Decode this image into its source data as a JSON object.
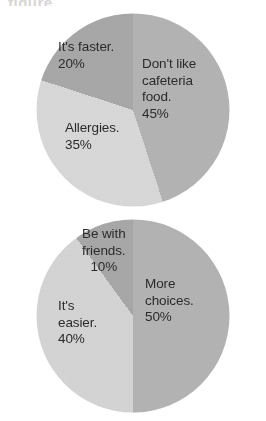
{
  "page": {
    "background": "#ffffff",
    "scan_artifact_text": "figure"
  },
  "palette": {
    "dark_gray": "#a9a9a9",
    "medium_gray": "#b6b6b6",
    "light_gray": "#d8d8d8",
    "lighter_gray": "#dcdcdc",
    "text": "#2b2b2b"
  },
  "charts": {
    "top": {
      "labels": {
        "faster": "It's faster.\n20%",
        "cafeteria": "Don't like\ncafeteria\nfood.\n45%",
        "allergies": "Allergies.\n35%"
      }
    },
    "bottom": {
      "labels": {
        "friends": "Be with\nfriends.\n10%",
        "choices": "More\nchoices.\n50%",
        "easier": "It's\neasier.\n40%"
      }
    }
  },
  "chart_data": [
    {
      "type": "pie",
      "title": "",
      "id": "top-pie",
      "categories": [
        "Don't like cafeteria food.",
        "Allergies.",
        "It's faster."
      ],
      "values": [
        45,
        35,
        20
      ],
      "unit": "%",
      "start_angle_deg": 0,
      "direction": "clockwise",
      "colors": [
        "#b6b6b6",
        "#dcdcdc",
        "#a9a9a9"
      ],
      "legend": "none",
      "labels_inside": true,
      "data_labels": [
        "45%",
        "35%",
        "20%"
      ]
    },
    {
      "type": "pie",
      "title": "",
      "id": "bottom-pie",
      "categories": [
        "More choices.",
        "It's easier.",
        "Be with friends."
      ],
      "values": [
        50,
        40,
        10
      ],
      "unit": "%",
      "start_angle_deg": 0,
      "direction": "clockwise",
      "colors": [
        "#b6b6b6",
        "#d8d8d8",
        "#a9a9a9"
      ],
      "legend": "none",
      "labels_inside": true,
      "data_labels": [
        "50%",
        "40%",
        "10%"
      ]
    }
  ]
}
